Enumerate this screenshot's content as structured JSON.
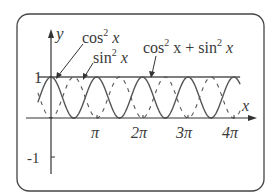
{
  "chart_data": {
    "type": "line",
    "title": "",
    "xlabel": "x",
    "ylabel": "y",
    "x_ticks": [
      {
        "value": 3.14159,
        "label": "π"
      },
      {
        "value": 6.28319,
        "label": "2π"
      },
      {
        "value": 9.42478,
        "label": "3π"
      },
      {
        "value": 12.56637,
        "label": "4π"
      }
    ],
    "y_ticks": [
      {
        "value": 1,
        "label": "1"
      },
      {
        "value": -1,
        "label": "-1"
      }
    ],
    "xlim": [
      -1.1,
      13.5
    ],
    "ylim": [
      -1.2,
      1.9
    ],
    "grid": false,
    "legend": "inline annotations with arrows",
    "series": [
      {
        "name": "cos² x",
        "expression": "cos(x)^2",
        "style": "solid",
        "x_range": [
          -0.9,
          13.0
        ]
      },
      {
        "name": "sin² x",
        "expression": "sin(x)^2",
        "style": "dashed",
        "x_range": [
          -0.9,
          13.0
        ]
      },
      {
        "name": "cos² x + sin² x",
        "expression": "1",
        "style": "solid",
        "x_range": [
          -0.9,
          13.0
        ]
      }
    ],
    "annotations": [
      {
        "text": "cos² x",
        "points_to": "cos² x curve near x=0.5"
      },
      {
        "text": "sin² x",
        "points_to": "sin² x curve near x=1.7"
      },
      {
        "text": "cos² x + sin² x",
        "points_to": "line y=1 near x=4"
      }
    ]
  },
  "labels": {
    "y_axis": "y",
    "x_axis": "x",
    "y_one": "1",
    "y_minus_one": "-1",
    "pi": "π",
    "two_pi": "2π",
    "three_pi": "3π",
    "four_pi": "4π",
    "cos2_base": "cos",
    "cos2_exp": "2",
    "cos2_var": "x",
    "sin2_base": "sin",
    "sin2_exp": "2",
    "sin2_var": "x",
    "sum_cos": "cos",
    "sum_exp1": "2",
    "sum_mid": "x + sin",
    "sum_exp2": "2",
    "sum_var": "x"
  },
  "colors": {
    "curve": "#555555",
    "axis": "#333333",
    "frame": "#444444",
    "text": "#3a3a3a"
  }
}
